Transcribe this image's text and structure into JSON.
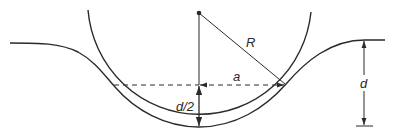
{
  "diagram": {
    "labels": {
      "radius": "R",
      "half_width": "a",
      "half_depth": "d/2",
      "depth": "d"
    },
    "colors": {
      "stroke": "#2a2a2a",
      "background": "#ffffff"
    },
    "elements": [
      "circle-arc",
      "wavy-surface-curve",
      "center-point",
      "radius-line",
      "vertical-center-line",
      "dashed-horizontal-line",
      "depth-dimension-arrow"
    ]
  }
}
